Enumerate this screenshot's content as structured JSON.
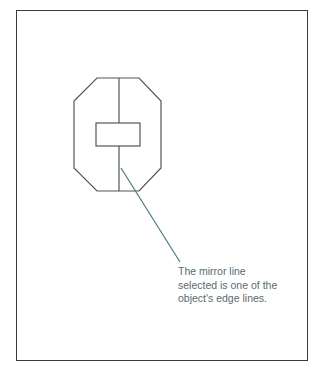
{
  "diagram": {
    "frame": {
      "stroke": "#3a3a3a"
    },
    "shape": {
      "name": "octagon-with-rectangle",
      "stroke": "#555555",
      "outline_points": "97,78 139,78 161,101 161,168 139,191 97,191 74,168 74,101",
      "mirror_line": {
        "x1": 119,
        "y1": 78,
        "x2": 119,
        "y2": 191
      },
      "rectangle": {
        "x": 96,
        "y": 123,
        "width": 44,
        "height": 23
      }
    },
    "callout": {
      "line_color": "#4a7a80",
      "line": {
        "x1": 121,
        "y1": 168,
        "x2": 180,
        "y2": 262
      },
      "text_lines": [
        "The mirror line",
        "selected is one of the",
        "object's edge lines."
      ]
    }
  }
}
